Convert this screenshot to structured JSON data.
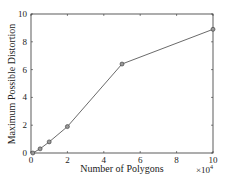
{
  "chart_data": {
    "type": "line",
    "title": "",
    "xlabel": "Number of Polygons",
    "ylabel": "Maximum Possible Distortion",
    "x_multiplier": "×10^4",
    "x_multiplier_base": "×10",
    "x_multiplier_exp": "4",
    "xlim": [
      0,
      10
    ],
    "ylim": [
      0,
      10
    ],
    "xticks": [
      "0",
      "2",
      "4",
      "6",
      "8",
      "10"
    ],
    "yticks": [
      "0",
      "2",
      "4",
      "6",
      "8",
      "10"
    ],
    "grid": false,
    "legend": null,
    "series": [
      {
        "name": "distortion",
        "marker": "circle",
        "color": "#333333",
        "x": [
          0.1,
          0.5,
          1,
          2,
          5,
          10
        ],
        "y": [
          0.0,
          0.3,
          0.8,
          1.9,
          6.4,
          8.9
        ]
      }
    ]
  }
}
